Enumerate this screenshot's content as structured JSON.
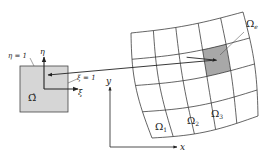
{
  "diagram": {
    "reference_element": {
      "label": "Ω̂",
      "fill": "#d6d6d6",
      "stroke": "#333333",
      "edge_labels": {
        "eta_edge": "η = 1",
        "xi_edge": "ξ = 1"
      },
      "axes": {
        "xi": "ξ",
        "eta": "η"
      }
    },
    "global_axes": {
      "x": "x",
      "y": "y"
    },
    "mesh": {
      "rows": 4,
      "cols": 5,
      "corners": {
        "top_left": [
          131,
          33
        ],
        "top_right": [
          243,
          12
        ],
        "bottom_left": [
          152,
          138
        ],
        "bottom_right": [
          258,
          116
        ]
      },
      "highlighted_cell": {
        "row": 1,
        "col": 3,
        "fill": "#a8a8a8"
      },
      "element_labels": [
        {
          "text": "Ω",
          "sub": "1",
          "x": 155,
          "y": 130
        },
        {
          "text": "Ω",
          "sub": "2",
          "x": 187,
          "y": 124
        },
        {
          "text": "Ω",
          "sub": "3",
          "x": 211,
          "y": 117
        },
        {
          "text": "Ω",
          "sub": "e",
          "x": 246,
          "y": 27
        }
      ]
    },
    "mapping_arrow": {
      "from": [
        247,
        56
      ],
      "to": [
        48,
        75
      ]
    }
  }
}
